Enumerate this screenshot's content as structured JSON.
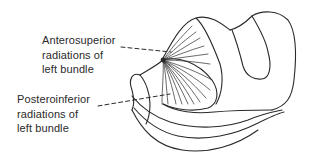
{
  "figure": {
    "labels": [
      {
        "id": "anterosuperior",
        "lines": [
          "Anterosuperior",
          "radiations of",
          "left bundle"
        ]
      },
      {
        "id": "posteroinferior",
        "lines": [
          "Posteroinferior",
          "radiations of",
          "left bundle"
        ]
      }
    ],
    "colors": {
      "line": "#2a2a2a",
      "background": "#ffffff"
    }
  }
}
